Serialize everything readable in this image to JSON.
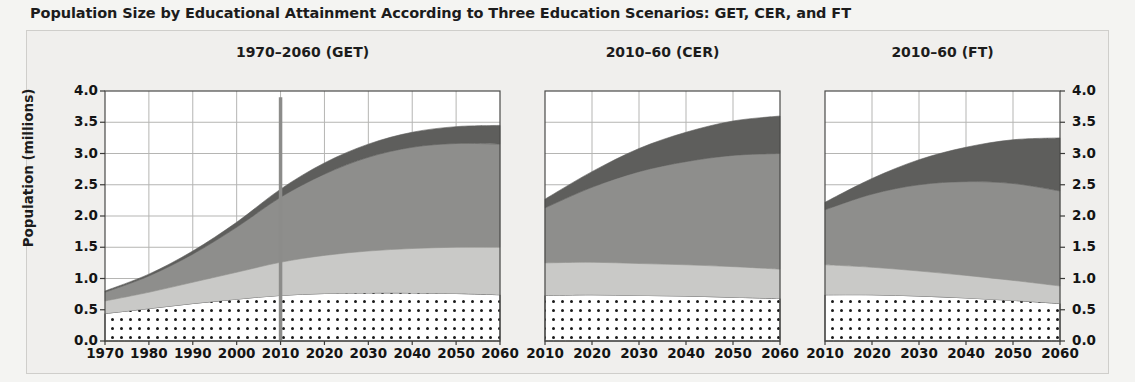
{
  "figure": {
    "title": "Population Size by Educational Attainment According to Three Education Scenarios: GET, CER, and FT",
    "ylabel": "Population (millions)",
    "ytick_labels": [
      "4.0",
      "3.5",
      "3.0",
      "2.5",
      "2.0",
      "1.5",
      "1.0",
      "0.5",
      "0.0"
    ]
  },
  "chart_data": {
    "type": "area",
    "title": "Population Size by Educational Attainment According to Three Education Scenarios: GET, CER, and FT",
    "xlabel": "",
    "ylabel": "Population (millions)",
    "ylim": [
      0,
      4
    ],
    "grid": true,
    "legend_position": "none",
    "stacked": true,
    "series_order": [
      "No education",
      "Primary",
      "Secondary",
      "Tertiary"
    ],
    "series_colors": {
      "No education": "#ffffff",
      "Primary": "#c9c9c7",
      "Secondary": "#8e8e8c",
      "Tertiary": "#5e5e5c"
    },
    "series_patterns": {
      "No education": "dotted",
      "Primary": "solid",
      "Secondary": "solid",
      "Tertiary": "solid"
    },
    "annotations": [
      {
        "type": "vline",
        "panel": 0,
        "x": 2010,
        "y_top": 3.9,
        "color": "#8c8c8a",
        "label": ""
      }
    ],
    "panels": [
      {
        "title": "1970–2060 (GET)",
        "xlim": [
          1970,
          2060
        ],
        "xticks": [
          1970,
          1980,
          1990,
          2000,
          2010,
          2020,
          2030,
          2040,
          2050,
          2060
        ],
        "x": [
          1970,
          1980,
          1990,
          2000,
          2010,
          2020,
          2030,
          2040,
          2050,
          2060
        ],
        "series": [
          {
            "name": "No education",
            "values": [
              0.44,
              0.52,
              0.6,
              0.67,
              0.73,
              0.76,
              0.77,
              0.77,
              0.76,
              0.74
            ]
          },
          {
            "name": "Primary",
            "values": [
              0.2,
              0.26,
              0.34,
              0.43,
              0.53,
              0.61,
              0.67,
              0.71,
              0.74,
              0.76
            ]
          },
          {
            "name": "Secondary",
            "values": [
              0.14,
              0.26,
              0.45,
              0.72,
              1.04,
              1.3,
              1.5,
              1.62,
              1.66,
              1.65
            ]
          },
          {
            "name": "Tertiary",
            "values": [
              0.02,
              0.03,
              0.05,
              0.08,
              0.13,
              0.18,
              0.21,
              0.24,
              0.27,
              0.3
            ]
          }
        ],
        "totals": [
          0.8,
          1.07,
          1.44,
          1.9,
          2.43,
          2.85,
          3.15,
          3.34,
          3.43,
          3.45
        ]
      },
      {
        "title": "2010–60 (CER)",
        "xlim": [
          2010,
          2060
        ],
        "xticks": [
          2010,
          2020,
          2030,
          2040,
          2050,
          2060
        ],
        "x": [
          2010,
          2020,
          2030,
          2040,
          2050,
          2060
        ],
        "series": [
          {
            "name": "No education",
            "values": [
              0.73,
              0.74,
              0.73,
              0.72,
              0.7,
              0.68
            ]
          },
          {
            "name": "Primary",
            "values": [
              0.52,
              0.52,
              0.51,
              0.5,
              0.49,
              0.47
            ]
          },
          {
            "name": "Secondary",
            "values": [
              0.88,
              1.2,
              1.47,
              1.65,
              1.78,
              1.85
            ]
          },
          {
            "name": "Tertiary",
            "values": [
              0.14,
              0.25,
              0.37,
              0.47,
              0.55,
              0.6
            ]
          }
        ],
        "totals": [
          2.27,
          2.71,
          3.08,
          3.34,
          3.52,
          3.6
        ]
      },
      {
        "title": "2010–60 (FT)",
        "xlim": [
          2010,
          2060
        ],
        "xticks": [
          2010,
          2020,
          2030,
          2040,
          2050,
          2060
        ],
        "x": [
          2010,
          2020,
          2030,
          2040,
          2050,
          2060
        ],
        "series": [
          {
            "name": "No education",
            "values": [
              0.74,
              0.74,
              0.72,
              0.69,
              0.65,
              0.6
            ]
          },
          {
            "name": "Primary",
            "values": [
              0.48,
              0.44,
              0.4,
              0.36,
              0.32,
              0.28
            ]
          },
          {
            "name": "Secondary",
            "values": [
              0.88,
              1.17,
              1.38,
              1.5,
              1.55,
              1.52
            ]
          },
          {
            "name": "Tertiary",
            "values": [
              0.12,
              0.25,
              0.4,
              0.55,
              0.7,
              0.85
            ]
          }
        ],
        "totals": [
          2.22,
          2.6,
          2.9,
          3.1,
          3.22,
          3.25
        ]
      }
    ]
  }
}
